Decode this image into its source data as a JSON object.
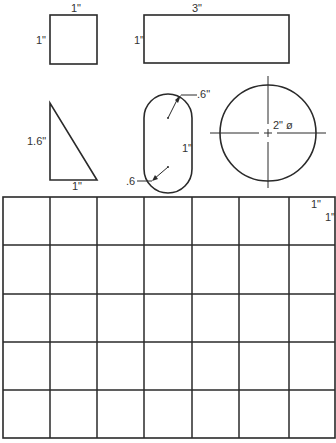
{
  "drawing": {
    "square": {
      "top_label": "1\"",
      "side_label": "1\""
    },
    "rectangle": {
      "top_label": "3\"",
      "side_label": "1\""
    },
    "triangle": {
      "height_label": "1.6\"",
      "base_label": "1\""
    },
    "obround": {
      "top_radius_label": ".6\"",
      "bottom_radius_label": ".6",
      "length_label": "1\""
    },
    "circle": {
      "diameter_label": "2\" ø"
    },
    "grid": {
      "columns": 7,
      "rows": 5,
      "cell_width_label": "1\"",
      "cell_height_label": "1\""
    }
  },
  "colors": {
    "line": "#2a2a2a",
    "background": "#ffffff"
  }
}
